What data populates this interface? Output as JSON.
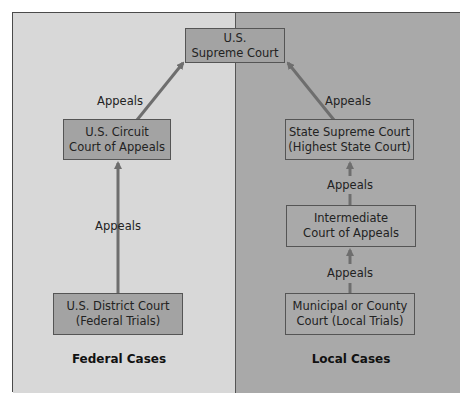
{
  "diagram": {
    "title": "",
    "colors": {
      "federal_panel": "#d8d8d8",
      "local_panel": "#a9a9a9",
      "box_fill": "#a3a3a3",
      "arrow": "#6e6e6e"
    },
    "nodes": {
      "supreme": {
        "line1": "U.S.",
        "line2": "Supreme Court"
      },
      "circuit": {
        "line1": "U.S. Circuit",
        "line2": "Court of Appeals"
      },
      "district": {
        "line1": "U.S. District Court",
        "line2": "(Federal Trials)"
      },
      "state_supreme": {
        "line1": "State Supreme Court",
        "line2": "(Highest State Court)"
      },
      "intermediate": {
        "line1": "Intermediate",
        "line2": "Court of Appeals"
      },
      "municipal": {
        "line1": "Municipal or County",
        "line2": "Court (Local Trials)"
      }
    },
    "edges": [
      {
        "from": "district",
        "to": "circuit",
        "label": "Appeals"
      },
      {
        "from": "circuit",
        "to": "supreme",
        "label": "Appeals"
      },
      {
        "from": "municipal",
        "to": "intermediate",
        "label": "Appeals"
      },
      {
        "from": "intermediate",
        "to": "state_supreme",
        "label": "Appeals"
      },
      {
        "from": "state_supreme",
        "to": "supreme",
        "label": "Appeals"
      }
    ],
    "sections": {
      "federal": "Federal Cases",
      "local": "Local Cases"
    }
  }
}
